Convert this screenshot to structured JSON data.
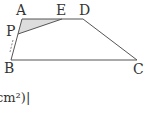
{
  "diagram": {
    "type": "trapezoid",
    "points": {
      "A": [
        22,
        19
      ],
      "E": [
        62,
        19
      ],
      "D": [
        83,
        19
      ],
      "P": [
        18,
        34
      ],
      "B": [
        11,
        60
      ],
      "C": [
        137,
        60
      ]
    },
    "labels": {
      "A": "A",
      "E": "E",
      "D": "D",
      "P": "P",
      "B": "B",
      "C": "C"
    },
    "shaded_region": [
      "A",
      "E",
      "P"
    ],
    "shade_color": "#dddddd",
    "line_color": "#555555",
    "motion_arrow": "P→B"
  },
  "caption": {
    "text": "cm²)|"
  }
}
